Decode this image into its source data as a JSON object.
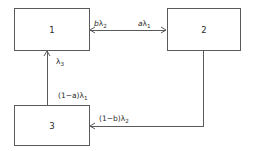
{
  "diagram": {
    "type": "block-flow-diagram",
    "background_color": "#ffffff",
    "line_color": "#5a5a5a",
    "text_color": "#2b2b2b",
    "nodes": [
      {
        "id": "node-1",
        "label": "1",
        "x": 14,
        "y": 8,
        "width": 75,
        "height": 42
      },
      {
        "id": "node-2",
        "label": "2",
        "x": 167,
        "y": 8,
        "width": 73,
        "height": 42
      },
      {
        "id": "node-3",
        "label": "3",
        "x": 14,
        "y": 105,
        "width": 75,
        "height": 40
      }
    ],
    "edges": [
      {
        "id": "edge-2-to-1",
        "from": "2",
        "to": "1",
        "label_main": "b",
        "label_lambda": "λ",
        "label_sub": "2",
        "label_text": "bλ2",
        "direction": "leftward",
        "arrowheads": "both"
      },
      {
        "id": "edge-1-to-2",
        "from": "1",
        "to": "2",
        "label_main": "a",
        "label_lambda": "λ",
        "label_sub": "1",
        "label_text": "aλ1",
        "direction": "rightward",
        "arrowheads": "both"
      },
      {
        "id": "edge-3-to-1-lambda3",
        "from": "3",
        "to": "1",
        "label_main": "",
        "label_lambda": "λ",
        "label_sub": "3",
        "label_text": "λ3",
        "direction": "upward",
        "arrowheads": "end"
      },
      {
        "id": "edge-1-to-3",
        "from": "1",
        "to": "3",
        "label_main": "(1−a)",
        "label_lambda": "λ",
        "label_sub": "1",
        "label_text": "(1−a)λ1",
        "direction": "downward",
        "arrowheads": "none"
      },
      {
        "id": "edge-2-to-3",
        "from": "2",
        "to": "3",
        "label_main": "(1−b)",
        "label_lambda": "λ",
        "label_sub": "2",
        "label_text": "(1−b)λ2",
        "direction": "leftward",
        "arrowheads": "end"
      }
    ]
  }
}
